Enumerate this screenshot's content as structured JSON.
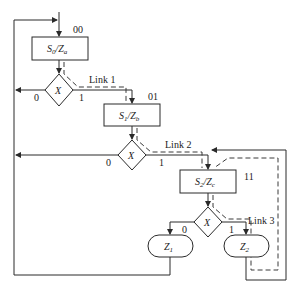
{
  "diagram": {
    "type": "ASM chart",
    "states": [
      {
        "id": "s0",
        "code": "00",
        "name": "S",
        "name_sub": "0",
        "output": "Z",
        "output_sub": "a"
      },
      {
        "id": "s1",
        "code": "01",
        "name": "S",
        "name_sub": "1",
        "output": "Z",
        "output_sub": "b"
      },
      {
        "id": "s2",
        "code": "11",
        "name": "S",
        "name_sub": "2",
        "output": "Z",
        "output_sub": "c"
      }
    ],
    "decisions": [
      {
        "id": "d0",
        "var": "X",
        "false_label": "0",
        "true_label": "1"
      },
      {
        "id": "d1",
        "var": "X",
        "false_label": "0",
        "true_label": "1"
      },
      {
        "id": "d2",
        "var": "X",
        "false_label": "0",
        "true_label": "1"
      }
    ],
    "conditional_outputs": [
      {
        "id": "z1",
        "name": "Z",
        "sub": "1"
      },
      {
        "id": "z2",
        "name": "Z",
        "sub": "2"
      }
    ],
    "links": [
      {
        "id": "link1",
        "label": "Link 1"
      },
      {
        "id": "link2",
        "label": "Link 2"
      },
      {
        "id": "link3",
        "label": "Link 3"
      }
    ],
    "slash": "/"
  }
}
